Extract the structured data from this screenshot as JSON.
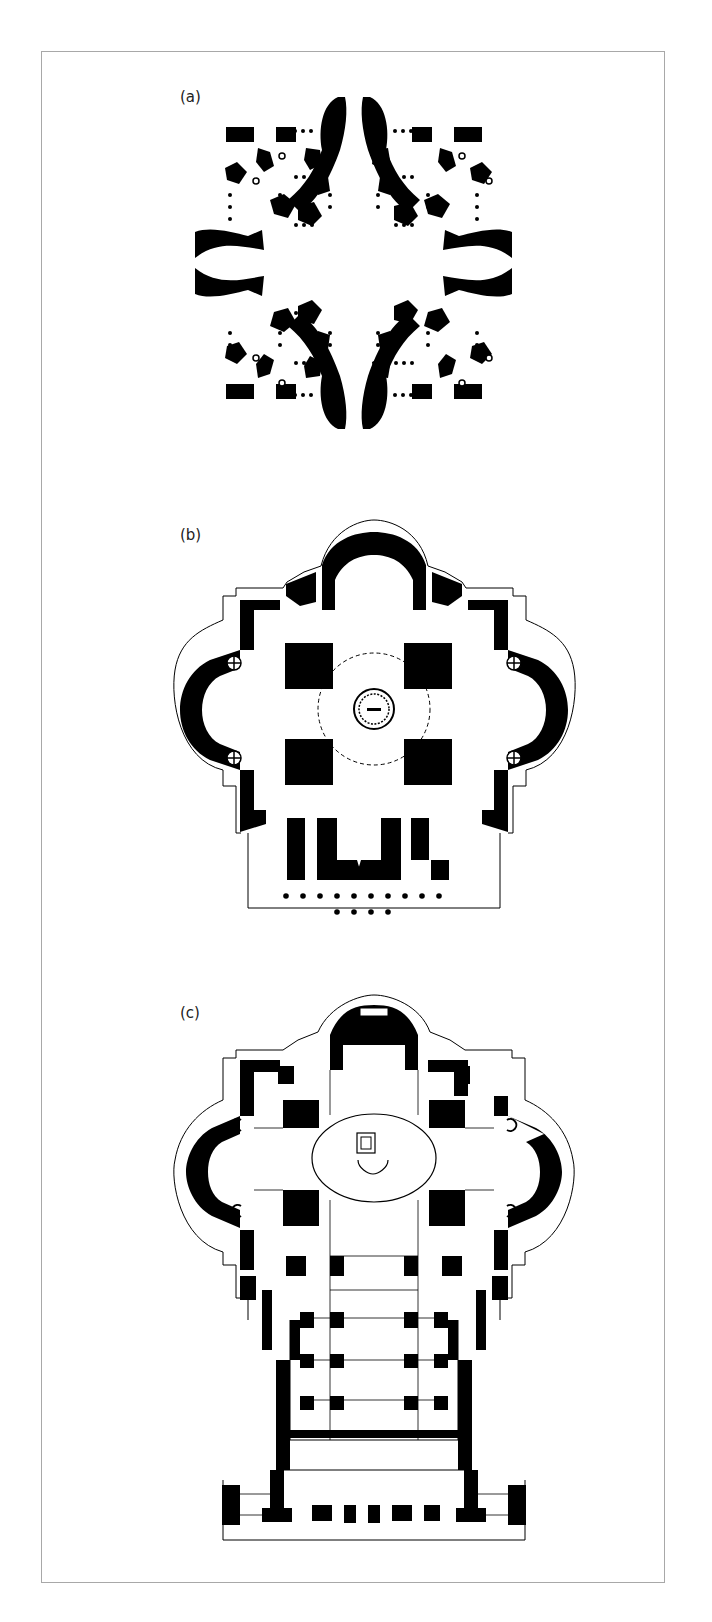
{
  "page": {
    "header_text_cut_off": "",
    "figure": {
      "panels": [
        {
          "id": "a",
          "label": "(a)",
          "description": "Greek-cross plan with four corner chapels and apse-ended arms (solid black walls, dotted column lines)"
        },
        {
          "id": "b",
          "label": "(b)",
          "description": "Centralized plan with four piers, dashed dome circle and central altar, with portico columns at front"
        },
        {
          "id": "c",
          "label": "(c)",
          "description": "Extended Latin-cross plan with nave, central dome oval with baldacchino, and facade with towers"
        }
      ]
    },
    "colors": {
      "wall": "#000000",
      "background": "#ffffff",
      "frame": "#a8a8a8",
      "text": "#222222"
    }
  }
}
